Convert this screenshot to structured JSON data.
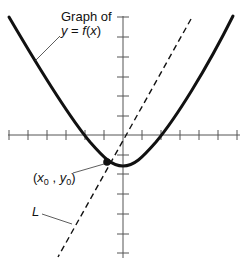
{
  "diagram": {
    "type": "function-graph-with-tangent-line",
    "colors": {
      "curve": "#111111",
      "axes": "#555555",
      "tangent_line": "#111111",
      "background": "#ffffff"
    },
    "axes": {
      "x_ticks_each_side": 6,
      "y_ticks_each_side": 6
    },
    "labels": {
      "graph_label_line1": "Graph of",
      "graph_label_line2_y": "y",
      "graph_label_line2_eq": " = ",
      "graph_label_line2_f": "f",
      "graph_label_line2_open": "(",
      "graph_label_line2_x": "x",
      "graph_label_line2_close": ")",
      "point_label_open": "(",
      "point_label_x": "x",
      "point_label_x_sub": "0",
      "point_label_comma": " , ",
      "point_label_y": "y",
      "point_label_y_sub": "0",
      "point_label_close": ")",
      "line_label": "L"
    },
    "curve": {
      "description": "Upward-opening parabola-like curve with vertex slightly below origin, crossing x-axis at about x = -2 and x = 2",
      "vertex_units": [
        0,
        -1.6
      ],
      "x_intercepts_units": [
        -2,
        2
      ]
    },
    "point": {
      "name": "(x0, y0)",
      "position_units": [
        -0.85,
        -1.4
      ]
    },
    "line": {
      "name": "L",
      "style": "dashed",
      "description": "Dashed line through (x0, y0), passing near the origin"
    }
  }
}
